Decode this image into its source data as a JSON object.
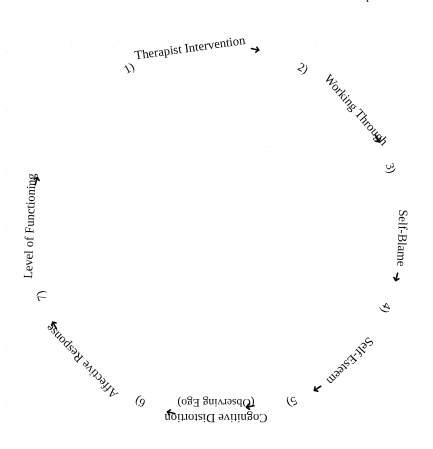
{
  "page": {
    "header": "The Therapeutic Process",
    "width": 433,
    "height": 449,
    "background": "#ffffff",
    "ink_color": "#0d0d0d"
  },
  "diagram": {
    "type": "cycle",
    "title": "The Therapeutic Process",
    "center_x": 216,
    "center_y": 232,
    "radius": 186,
    "direction": "clockwise",
    "stage_count": 7,
    "arrow_glyph_right": "➜",
    "arrow_glyph_left": "➜",
    "stages": [
      {
        "number": "1)",
        "label": "Therapist Intervention",
        "sub_label": "",
        "angle_deg": -118,
        "label_angle_deg": -98
      },
      {
        "number": "2)",
        "label": "Working Through",
        "sub_label": "",
        "angle_deg": -62,
        "label_angle_deg": -41
      },
      {
        "number": "3)",
        "label": "Self-Blame",
        "sub_label": "",
        "angle_deg": -20,
        "label_angle_deg": 2
      },
      {
        "number": "4)",
        "label": "Self-Esteem",
        "sub_label": "",
        "angle_deg": 24,
        "label_angle_deg": 44
      },
      {
        "number": "5)",
        "label": "Cognitive Distortion",
        "sub_label": "(Observing Ego)",
        "angle_deg": 66,
        "label_angle_deg": 90
      },
      {
        "number": "6)",
        "label": "Affective Response",
        "sub_label": "",
        "angle_deg": 114,
        "label_angle_deg": 136
      },
      {
        "number": "7)",
        "label": "Level of Functioning",
        "sub_label": "",
        "angle_deg": 160,
        "label_angle_deg": 182
      }
    ],
    "connectors": [
      {
        "from": "7)",
        "to": "1)",
        "glyph": "➜",
        "angle_deg": 196
      },
      {
        "from": "1)",
        "to": "2)",
        "glyph": "➜",
        "angle_deg": -78
      },
      {
        "from": "2)",
        "to": "3)",
        "glyph": "➜",
        "angle_deg": -30
      },
      {
        "from": "3)",
        "to": "4)",
        "glyph": "➜",
        "angle_deg": 14
      },
      {
        "from": "4)",
        "to": "5)",
        "glyph": "➜",
        "angle_deg": 57
      },
      {
        "from": "5)",
        "to": "6)",
        "glyph": "➜",
        "angle_deg": 104
      },
      {
        "from": "6)",
        "to": "7)",
        "glyph": "➜",
        "angle_deg": 150
      },
      {
        "from": "observing-ego",
        "to": "5)",
        "glyph": "➜",
        "angle_deg": 79
      }
    ]
  }
}
